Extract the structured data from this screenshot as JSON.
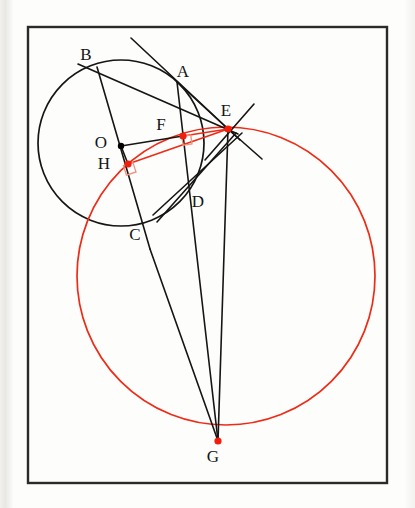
{
  "figure": {
    "canvas": {
      "width": 415,
      "height": 508
    },
    "frame": {
      "x": 28,
      "y": 27,
      "width": 359,
      "height": 456,
      "stroke": "#2b2a28",
      "stroke_width": 2.4
    },
    "colors": {
      "black": "#161513",
      "red": "#ee2b16",
      "right_angle_mark": "#f0907f",
      "dot_red": "#f21d0a",
      "dot_black": "#000000",
      "paper": "#fdfdfc"
    },
    "circles": [
      {
        "name": "small-black-circle",
        "center_label": "O",
        "cx": 121,
        "cy": 143,
        "r": 83,
        "stroke": "#161513",
        "stroke_width": 1.7
      },
      {
        "name": "large-red-circle",
        "center_label": "",
        "cx": 226,
        "cy": 276,
        "r": 149,
        "stroke": "#ee2b16",
        "stroke_width": 1.7
      }
    ],
    "points": [
      {
        "label": "A",
        "x": 177,
        "y": 82,
        "dot": "none",
        "label_dx": 6,
        "label_dy": -5
      },
      {
        "label": "B",
        "x": 97,
        "y": 67,
        "dot": "none",
        "label_dx": -11,
        "label_dy": -7
      },
      {
        "label": "C",
        "x": 140,
        "y": 222,
        "dot": "none",
        "label_dx": -5,
        "label_dy": 18
      },
      {
        "label": "D",
        "x": 190,
        "y": 195,
        "dot": "none",
        "label_dx": 8,
        "label_dy": 12
      },
      {
        "label": "E",
        "x": 228,
        "y": 129,
        "dot": "red",
        "label_dx": -2,
        "label_dy": -13
      },
      {
        "label": "F",
        "x": 183,
        "y": 136,
        "dot": "red",
        "label_dx": -22,
        "label_dy": -6
      },
      {
        "label": "G",
        "x": 218,
        "y": 441,
        "dot": "red",
        "label_dx": -5,
        "label_dy": 21
      },
      {
        "label": "H",
        "x": 128,
        "y": 164,
        "dot": "red",
        "label_dx": -24,
        "label_dy": 5
      },
      {
        "label": "O",
        "x": 121,
        "y": 146,
        "dot": "black",
        "label_dx": -20,
        "label_dy": 2
      }
    ],
    "segments": [
      {
        "name": "tangent-through-A-to-E",
        "x1": 131,
        "y1": 38,
        "x2": 240,
        "y2": 140,
        "color": "black"
      },
      {
        "name": "chord-B-to-A-extended",
        "x1": 78,
        "y1": 64,
        "x2": 238,
        "y2": 134,
        "color": "black"
      },
      {
        "name": "chord-B-to-C-through-H",
        "x1": 97,
        "y1": 67,
        "x2": 150,
        "y2": 249,
        "color": "black"
      },
      {
        "name": "line-B-C-to-G",
        "x1": 150,
        "y1": 249,
        "x2": 218,
        "y2": 441,
        "color": "black"
      },
      {
        "name": "line-A-F-D-to-G",
        "x1": 177,
        "y1": 82,
        "x2": 218,
        "y2": 441,
        "color": "black"
      },
      {
        "name": "line-E-to-G",
        "x1": 228,
        "y1": 129,
        "x2": 218,
        "y2": 441,
        "color": "black"
      },
      {
        "name": "line-A-to-E",
        "x1": 177,
        "y1": 82,
        "x2": 228,
        "y2": 129,
        "color": "black"
      },
      {
        "name": "secant-E-through-D-to-C",
        "x1": 242,
        "y1": 133,
        "x2": 153,
        "y2": 215,
        "color": "black"
      },
      {
        "name": "secant-E-lower-branch",
        "x1": 236,
        "y1": 133,
        "x2": 157,
        "y2": 222,
        "color": "black"
      },
      {
        "name": "tangent-at-E-upper",
        "x1": 254,
        "y1": 104,
        "x2": 205,
        "y2": 160,
        "color": "black"
      },
      {
        "name": "tangent-at-E-lower",
        "x1": 228,
        "y1": 129,
        "x2": 262,
        "y2": 159,
        "color": "black"
      },
      {
        "name": "radius-O-to-F",
        "x1": 121,
        "y1": 146,
        "x2": 183,
        "y2": 136,
        "color": "black"
      },
      {
        "name": "segment-F-to-E",
        "x1": 183,
        "y1": 136,
        "x2": 228,
        "y2": 129,
        "color": "red"
      },
      {
        "name": "segment-O-to-H",
        "x1": 121,
        "y1": 146,
        "x2": 128,
        "y2": 164,
        "color": "black"
      },
      {
        "name": "segment-H-to-E",
        "x1": 128,
        "y1": 164,
        "x2": 228,
        "y2": 129,
        "color": "red"
      }
    ],
    "right_angle_marks": [
      {
        "name": "right-angle-at-F",
        "vertex_x": 192,
        "vertex_y": 144,
        "size": 9,
        "rotation": -8
      },
      {
        "name": "right-angle-at-H",
        "vertex_x": 136,
        "vertex_y": 172,
        "size": 10,
        "rotation": -18
      }
    ]
  }
}
